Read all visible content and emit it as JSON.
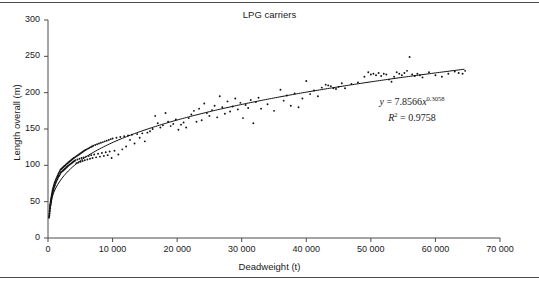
{
  "chart_data": {
    "type": "scatter",
    "title": "LPG carriers",
    "xlabel": "Deadweight (t)",
    "ylabel": "Length overall (m)",
    "xlim": [
      0,
      70000
    ],
    "ylim": [
      0,
      300
    ],
    "xticks": [
      0,
      10000,
      20000,
      30000,
      40000,
      50000,
      60000,
      70000
    ],
    "xtick_labels": [
      "0",
      "10 000",
      "20 000",
      "30 000",
      "40 000",
      "50 000",
      "60 000",
      "70 000"
    ],
    "yticks": [
      0,
      50,
      100,
      150,
      200,
      250,
      300
    ],
    "ytick_labels": [
      "0",
      "50",
      "100",
      "150",
      "200",
      "250",
      "300"
    ],
    "grid": false,
    "legend": null,
    "marker_color": "#111111",
    "line_color": "#111111",
    "annotations": {
      "equation_y": "y",
      "equation_eq": " = 7.8566",
      "equation_x": "x",
      "equation_exp": "0.3058",
      "r_squared_sym": "R",
      "r_squared_exp": "2",
      "r_squared_val": " = 0.9758"
    },
    "fit": {
      "form": "power",
      "coefficient": 7.8566,
      "exponent": 0.3058,
      "r_squared": 0.9758,
      "x_start": 250,
      "x_end": 64500
    },
    "series": [
      {
        "name": "LPG carriers",
        "points": [
          [
            160,
            28
          ],
          [
            180,
            30
          ],
          [
            200,
            33
          ],
          [
            210,
            31
          ],
          [
            230,
            36
          ],
          [
            250,
            34
          ],
          [
            260,
            38
          ],
          [
            280,
            40
          ],
          [
            300,
            37
          ],
          [
            310,
            42
          ],
          [
            330,
            44
          ],
          [
            350,
            41
          ],
          [
            360,
            46
          ],
          [
            380,
            48
          ],
          [
            400,
            45
          ],
          [
            410,
            50
          ],
          [
            430,
            47
          ],
          [
            450,
            52
          ],
          [
            470,
            49
          ],
          [
            480,
            54
          ],
          [
            500,
            51
          ],
          [
            520,
            56
          ],
          [
            540,
            53
          ],
          [
            560,
            58
          ],
          [
            580,
            55
          ],
          [
            600,
            60
          ],
          [
            620,
            57
          ],
          [
            640,
            62
          ],
          [
            660,
            59
          ],
          [
            680,
            64
          ],
          [
            700,
            61
          ],
          [
            720,
            66
          ],
          [
            750,
            63
          ],
          [
            780,
            68
          ],
          [
            800,
            65
          ],
          [
            830,
            70
          ],
          [
            860,
            67
          ],
          [
            900,
            72
          ],
          [
            930,
            69
          ],
          [
            960,
            74
          ],
          [
            1000,
            71
          ],
          [
            1040,
            76
          ],
          [
            1080,
            73
          ],
          [
            1120,
            78
          ],
          [
            1160,
            75
          ],
          [
            1200,
            80
          ],
          [
            1250,
            77
          ],
          [
            1300,
            82
          ],
          [
            1350,
            79
          ],
          [
            1400,
            84
          ],
          [
            1450,
            81
          ],
          [
            1500,
            86
          ],
          [
            1550,
            83
          ],
          [
            1600,
            88
          ],
          [
            1650,
            85
          ],
          [
            1700,
            90
          ],
          [
            1760,
            86
          ],
          [
            1820,
            92
          ],
          [
            1880,
            88
          ],
          [
            1940,
            94
          ],
          [
            2000,
            90
          ],
          [
            2060,
            95
          ],
          [
            2120,
            91
          ],
          [
            2180,
            96
          ],
          [
            2240,
            92
          ],
          [
            2300,
            97
          ],
          [
            2360,
            93
          ],
          [
            2420,
            98
          ],
          [
            2480,
            94
          ],
          [
            2540,
            99
          ],
          [
            2600,
            95
          ],
          [
            2660,
            100
          ],
          [
            2720,
            96
          ],
          [
            2780,
            101
          ],
          [
            2840,
            97
          ],
          [
            2900,
            102
          ],
          [
            2960,
            98
          ],
          [
            3020,
            103
          ],
          [
            3080,
            99
          ],
          [
            3150,
            104
          ],
          [
            3220,
            100
          ],
          [
            3290,
            105
          ],
          [
            3360,
            101
          ],
          [
            3430,
            106
          ],
          [
            3500,
            102
          ],
          [
            3570,
            107
          ],
          [
            3640,
            103
          ],
          [
            3710,
            108
          ],
          [
            3780,
            104
          ],
          [
            3850,
            109
          ],
          [
            3920,
            105
          ],
          [
            4000,
            110
          ],
          [
            4080,
            106
          ],
          [
            4160,
            111
          ],
          [
            4240,
            107
          ],
          [
            4320,
            112
          ],
          [
            4400,
            103
          ],
          [
            4480,
            113
          ],
          [
            4560,
            108
          ],
          [
            4640,
            114
          ],
          [
            4720,
            104
          ],
          [
            4800,
            115
          ],
          [
            4880,
            109
          ],
          [
            4960,
            116
          ],
          [
            5040,
            105
          ],
          [
            5120,
            117
          ],
          [
            5200,
            110
          ],
          [
            5280,
            118
          ],
          [
            5360,
            106
          ],
          [
            5440,
            119
          ],
          [
            5520,
            111
          ],
          [
            5600,
            120
          ],
          [
            5700,
            107
          ],
          [
            5800,
            121
          ],
          [
            5900,
            112
          ],
          [
            6000,
            122
          ],
          [
            6100,
            108
          ],
          [
            6200,
            123
          ],
          [
            6300,
            113
          ],
          [
            6400,
            124
          ],
          [
            6500,
            109
          ],
          [
            6600,
            125
          ],
          [
            6700,
            114
          ],
          [
            6800,
            126
          ],
          [
            6900,
            110
          ],
          [
            7000,
            127
          ],
          [
            7150,
            115
          ],
          [
            7300,
            128
          ],
          [
            7450,
            111
          ],
          [
            7600,
            129
          ],
          [
            7750,
            116
          ],
          [
            7900,
            130
          ],
          [
            8050,
            112
          ],
          [
            8200,
            131
          ],
          [
            8350,
            117
          ],
          [
            8500,
            132
          ],
          [
            8650,
            113
          ],
          [
            8800,
            133
          ],
          [
            8950,
            118
          ],
          [
            9100,
            134
          ],
          [
            9250,
            114
          ],
          [
            9400,
            135
          ],
          [
            9550,
            119
          ],
          [
            9700,
            136
          ],
          [
            9850,
            110
          ],
          [
            10000,
            137
          ],
          [
            10300,
            120
          ],
          [
            10600,
            138
          ],
          [
            10900,
            115
          ],
          [
            11200,
            139
          ],
          [
            11500,
            122
          ],
          [
            11800,
            140
          ],
          [
            12100,
            126
          ],
          [
            12400,
            141
          ],
          [
            12700,
            135
          ],
          [
            13000,
            142
          ],
          [
            13400,
            130
          ],
          [
            13800,
            143
          ],
          [
            14200,
            138
          ],
          [
            14600,
            144
          ],
          [
            15000,
            133
          ],
          [
            15400,
            145
          ],
          [
            15800,
            147
          ],
          [
            16200,
            150
          ],
          [
            16600,
            168
          ],
          [
            17000,
            158
          ],
          [
            17400,
            152
          ],
          [
            17800,
            155
          ],
          [
            18200,
            172
          ],
          [
            18600,
            160
          ],
          [
            19000,
            154
          ],
          [
            19400,
            157
          ],
          [
            19800,
            163
          ],
          [
            20200,
            149
          ],
          [
            20600,
            156
          ],
          [
            21000,
            159
          ],
          [
            21400,
            152
          ],
          [
            21800,
            165
          ],
          [
            22200,
            170
          ],
          [
            22600,
            175
          ],
          [
            23000,
            160
          ],
          [
            23400,
            178
          ],
          [
            23800,
            162
          ],
          [
            24200,
            185
          ],
          [
            24600,
            172
          ],
          [
            25000,
            168
          ],
          [
            25400,
            176
          ],
          [
            25800,
            182
          ],
          [
            26200,
            166
          ],
          [
            26600,
            195
          ],
          [
            27000,
            180
          ],
          [
            27400,
            171
          ],
          [
            27800,
            188
          ],
          [
            28200,
            174
          ],
          [
            28600,
            181
          ],
          [
            29000,
            192
          ],
          [
            29400,
            177
          ],
          [
            29800,
            186
          ],
          [
            30200,
            165
          ],
          [
            30600,
            183
          ],
          [
            31000,
            179
          ],
          [
            31400,
            190
          ],
          [
            31800,
            158
          ],
          [
            32200,
            187
          ],
          [
            32600,
            193
          ],
          [
            33000,
            178
          ],
          [
            34000,
            184
          ],
          [
            35000,
            175
          ],
          [
            36000,
            204
          ],
          [
            36500,
            189
          ],
          [
            37000,
            196
          ],
          [
            37600,
            182
          ],
          [
            38200,
            199
          ],
          [
            38800,
            180
          ],
          [
            39400,
            192
          ],
          [
            40000,
            216
          ],
          [
            40600,
            198
          ],
          [
            41200,
            203
          ],
          [
            41800,
            195
          ],
          [
            42400,
            207
          ],
          [
            43000,
            211
          ],
          [
            43400,
            210
          ],
          [
            43800,
            209
          ],
          [
            44200,
            206
          ],
          [
            44600,
            205
          ],
          [
            45000,
            208
          ],
          [
            45500,
            213
          ],
          [
            46000,
            206
          ],
          [
            47000,
            212
          ],
          [
            48000,
            214
          ],
          [
            49000,
            222
          ],
          [
            49600,
            228
          ],
          [
            50000,
            225
          ],
          [
            50400,
            226
          ],
          [
            50800,
            224
          ],
          [
            51200,
            227
          ],
          [
            51600,
            223
          ],
          [
            52000,
            226
          ],
          [
            52400,
            225
          ],
          [
            52800,
            218
          ],
          [
            53200,
            215
          ],
          [
            53600,
            222
          ],
          [
            54000,
            228
          ],
          [
            54400,
            226
          ],
          [
            54800,
            224
          ],
          [
            55200,
            227
          ],
          [
            55600,
            230
          ],
          [
            56000,
            249
          ],
          [
            56400,
            225
          ],
          [
            56800,
            223
          ],
          [
            57200,
            226
          ],
          [
            57600,
            224
          ],
          [
            58000,
            221
          ],
          [
            59000,
            228
          ],
          [
            60000,
            224
          ],
          [
            61000,
            222
          ],
          [
            62000,
            226
          ],
          [
            63000,
            229
          ],
          [
            63600,
            227
          ],
          [
            64200,
            226
          ],
          [
            64600,
            230
          ]
        ]
      }
    ]
  },
  "figure": {
    "top_rule": "",
    "bottom_rule": ""
  }
}
